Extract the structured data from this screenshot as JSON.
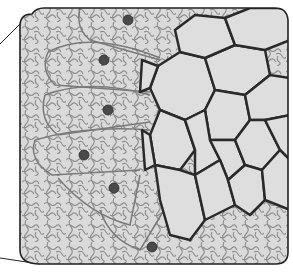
{
  "figure": {
    "colors": {
      "background": "#ffffff",
      "cell_fill": "#d9d9d9",
      "large_cell_fill": "#dcdcdc",
      "cell_wall": "#2a2a2a",
      "wavy_wall": "#8a8a8a",
      "nucleus": "#4a4a4a",
      "frame": "#222222"
    },
    "nuclei": [
      {
        "cx": 128,
        "cy": 20,
        "r": 5
      },
      {
        "cx": 104,
        "cy": 60,
        "r": 5
      },
      {
        "cx": 108,
        "cy": 110,
        "r": 5
      },
      {
        "cx": 84,
        "cy": 155,
        "r": 5
      },
      {
        "cx": 114,
        "cy": 188,
        "r": 5
      },
      {
        "cx": 152,
        "cy": 247,
        "r": 5
      }
    ]
  }
}
